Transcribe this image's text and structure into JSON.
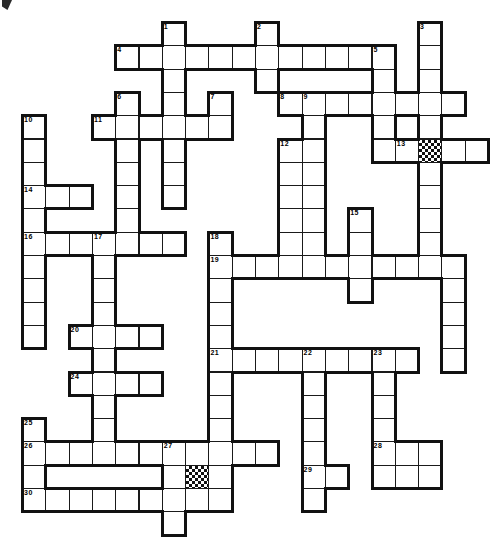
{
  "puzzle": {
    "title": "Crossword Puzzle Grid",
    "cell_size": 23.3,
    "origin_x": 22,
    "origin_y": 22,
    "cols": 20,
    "rows": 22,
    "line_color": "#111111",
    "cell_fill": "#ffffff",
    "shaded_fill_pattern": "checkerboard",
    "numbers_count": 30,
    "shaded_cells": [
      {
        "col": 17,
        "row": 5
      },
      {
        "col": 7,
        "row": 19
      }
    ],
    "clue_numbers": [
      {
        "n": "1",
        "col": 6,
        "row": 0
      },
      {
        "n": "2",
        "col": 10,
        "row": 0
      },
      {
        "n": "3",
        "col": 17,
        "row": 0
      },
      {
        "n": "4",
        "col": 4,
        "row": 1
      },
      {
        "n": "5",
        "col": 15,
        "row": 1
      },
      {
        "n": "6",
        "col": 4,
        "row": 3
      },
      {
        "n": "7",
        "col": 8,
        "row": 3
      },
      {
        "n": "8",
        "col": 11,
        "row": 3
      },
      {
        "n": "9",
        "col": 12,
        "row": 3
      },
      {
        "n": "10",
        "col": 0,
        "row": 4
      },
      {
        "n": "11",
        "col": 3,
        "row": 4
      },
      {
        "n": "12",
        "col": 11,
        "row": 5
      },
      {
        "n": "13",
        "col": 16,
        "row": 5
      },
      {
        "n": "14",
        "col": 0,
        "row": 7
      },
      {
        "n": "15",
        "col": 14,
        "row": 8
      },
      {
        "n": "16",
        "col": 0,
        "row": 9
      },
      {
        "n": "17",
        "col": 3,
        "row": 9
      },
      {
        "n": "18",
        "col": 8,
        "row": 9
      },
      {
        "n": "19",
        "col": 8,
        "row": 10
      },
      {
        "n": "20",
        "col": 2,
        "row": 13
      },
      {
        "n": "21",
        "col": 8,
        "row": 14
      },
      {
        "n": "22",
        "col": 12,
        "row": 14
      },
      {
        "n": "23",
        "col": 15,
        "row": 14
      },
      {
        "n": "24",
        "col": 2,
        "row": 15
      },
      {
        "n": "25",
        "col": 0,
        "row": 17
      },
      {
        "n": "26",
        "col": 0,
        "row": 18
      },
      {
        "n": "27",
        "col": 6,
        "row": 18
      },
      {
        "n": "28",
        "col": 15,
        "row": 18
      },
      {
        "n": "29",
        "col": 12,
        "row": 19
      },
      {
        "n": "30",
        "col": 0,
        "row": 20
      }
    ],
    "cells": [
      {
        "col": 6,
        "row": 0
      },
      {
        "col": 10,
        "row": 0
      },
      {
        "col": 17,
        "row": 0
      },
      {
        "col": 4,
        "row": 1
      },
      {
        "col": 5,
        "row": 1
      },
      {
        "col": 6,
        "row": 1
      },
      {
        "col": 7,
        "row": 1
      },
      {
        "col": 8,
        "row": 1
      },
      {
        "col": 9,
        "row": 1
      },
      {
        "col": 10,
        "row": 1
      },
      {
        "col": 11,
        "row": 1
      },
      {
        "col": 12,
        "row": 1
      },
      {
        "col": 13,
        "row": 1
      },
      {
        "col": 14,
        "row": 1
      },
      {
        "col": 15,
        "row": 1
      },
      {
        "col": 17,
        "row": 1
      },
      {
        "col": 6,
        "row": 2
      },
      {
        "col": 10,
        "row": 2
      },
      {
        "col": 15,
        "row": 2
      },
      {
        "col": 17,
        "row": 2
      },
      {
        "col": 4,
        "row": 3
      },
      {
        "col": 6,
        "row": 3
      },
      {
        "col": 8,
        "row": 3
      },
      {
        "col": 11,
        "row": 3
      },
      {
        "col": 12,
        "row": 3
      },
      {
        "col": 13,
        "row": 3
      },
      {
        "col": 14,
        "row": 3
      },
      {
        "col": 15,
        "row": 3
      },
      {
        "col": 16,
        "row": 3
      },
      {
        "col": 17,
        "row": 3
      },
      {
        "col": 18,
        "row": 3
      },
      {
        "col": 0,
        "row": 4
      },
      {
        "col": 3,
        "row": 4
      },
      {
        "col": 4,
        "row": 4
      },
      {
        "col": 5,
        "row": 4
      },
      {
        "col": 6,
        "row": 4
      },
      {
        "col": 7,
        "row": 4
      },
      {
        "col": 8,
        "row": 4
      },
      {
        "col": 12,
        "row": 4
      },
      {
        "col": 15,
        "row": 4
      },
      {
        "col": 17,
        "row": 4
      },
      {
        "col": 0,
        "row": 5
      },
      {
        "col": 4,
        "row": 5
      },
      {
        "col": 6,
        "row": 5
      },
      {
        "col": 11,
        "row": 5
      },
      {
        "col": 12,
        "row": 5
      },
      {
        "col": 15,
        "row": 5
      },
      {
        "col": 16,
        "row": 5
      },
      {
        "col": 17,
        "row": 5
      },
      {
        "col": 18,
        "row": 5
      },
      {
        "col": 19,
        "row": 5
      },
      {
        "col": 0,
        "row": 6
      },
      {
        "col": 4,
        "row": 6
      },
      {
        "col": 6,
        "row": 6
      },
      {
        "col": 11,
        "row": 6
      },
      {
        "col": 12,
        "row": 6
      },
      {
        "col": 17,
        "row": 6
      },
      {
        "col": 0,
        "row": 7
      },
      {
        "col": 1,
        "row": 7
      },
      {
        "col": 2,
        "row": 7
      },
      {
        "col": 4,
        "row": 7
      },
      {
        "col": 6,
        "row": 7
      },
      {
        "col": 11,
        "row": 7
      },
      {
        "col": 12,
        "row": 7
      },
      {
        "col": 17,
        "row": 7
      },
      {
        "col": 0,
        "row": 8
      },
      {
        "col": 4,
        "row": 8
      },
      {
        "col": 11,
        "row": 8
      },
      {
        "col": 12,
        "row": 8
      },
      {
        "col": 14,
        "row": 8
      },
      {
        "col": 17,
        "row": 8
      },
      {
        "col": 0,
        "row": 9
      },
      {
        "col": 1,
        "row": 9
      },
      {
        "col": 2,
        "row": 9
      },
      {
        "col": 3,
        "row": 9
      },
      {
        "col": 4,
        "row": 9
      },
      {
        "col": 5,
        "row": 9
      },
      {
        "col": 6,
        "row": 9
      },
      {
        "col": 8,
        "row": 9
      },
      {
        "col": 11,
        "row": 9
      },
      {
        "col": 12,
        "row": 9
      },
      {
        "col": 14,
        "row": 9
      },
      {
        "col": 17,
        "row": 9
      },
      {
        "col": 0,
        "row": 10
      },
      {
        "col": 3,
        "row": 10
      },
      {
        "col": 8,
        "row": 10
      },
      {
        "col": 9,
        "row": 10
      },
      {
        "col": 10,
        "row": 10
      },
      {
        "col": 11,
        "row": 10
      },
      {
        "col": 12,
        "row": 10
      },
      {
        "col": 13,
        "row": 10
      },
      {
        "col": 14,
        "row": 10
      },
      {
        "col": 15,
        "row": 10
      },
      {
        "col": 16,
        "row": 10
      },
      {
        "col": 17,
        "row": 10
      },
      {
        "col": 18,
        "row": 10
      },
      {
        "col": 0,
        "row": 11
      },
      {
        "col": 3,
        "row": 11
      },
      {
        "col": 8,
        "row": 11
      },
      {
        "col": 14,
        "row": 11
      },
      {
        "col": 18,
        "row": 11
      },
      {
        "col": 0,
        "row": 12
      },
      {
        "col": 3,
        "row": 12
      },
      {
        "col": 8,
        "row": 12
      },
      {
        "col": 18,
        "row": 12
      },
      {
        "col": 0,
        "row": 13
      },
      {
        "col": 2,
        "row": 13
      },
      {
        "col": 3,
        "row": 13
      },
      {
        "col": 4,
        "row": 13
      },
      {
        "col": 5,
        "row": 13
      },
      {
        "col": 8,
        "row": 13
      },
      {
        "col": 18,
        "row": 13
      },
      {
        "col": 3,
        "row": 14
      },
      {
        "col": 8,
        "row": 14
      },
      {
        "col": 9,
        "row": 14
      },
      {
        "col": 10,
        "row": 14
      },
      {
        "col": 11,
        "row": 14
      },
      {
        "col": 12,
        "row": 14
      },
      {
        "col": 13,
        "row": 14
      },
      {
        "col": 14,
        "row": 14
      },
      {
        "col": 15,
        "row": 14
      },
      {
        "col": 16,
        "row": 14
      },
      {
        "col": 18,
        "row": 14
      },
      {
        "col": 2,
        "row": 15
      },
      {
        "col": 3,
        "row": 15
      },
      {
        "col": 4,
        "row": 15
      },
      {
        "col": 5,
        "row": 15
      },
      {
        "col": 8,
        "row": 15
      },
      {
        "col": 12,
        "row": 15
      },
      {
        "col": 15,
        "row": 15
      },
      {
        "col": 3,
        "row": 16
      },
      {
        "col": 8,
        "row": 16
      },
      {
        "col": 12,
        "row": 16
      },
      {
        "col": 15,
        "row": 16
      },
      {
        "col": 0,
        "row": 17
      },
      {
        "col": 3,
        "row": 17
      },
      {
        "col": 8,
        "row": 17
      },
      {
        "col": 12,
        "row": 17
      },
      {
        "col": 15,
        "row": 17
      },
      {
        "col": 0,
        "row": 18
      },
      {
        "col": 1,
        "row": 18
      },
      {
        "col": 2,
        "row": 18
      },
      {
        "col": 3,
        "row": 18
      },
      {
        "col": 4,
        "row": 18
      },
      {
        "col": 5,
        "row": 18
      },
      {
        "col": 6,
        "row": 18
      },
      {
        "col": 7,
        "row": 18
      },
      {
        "col": 8,
        "row": 18
      },
      {
        "col": 9,
        "row": 18
      },
      {
        "col": 10,
        "row": 18
      },
      {
        "col": 12,
        "row": 18
      },
      {
        "col": 15,
        "row": 18
      },
      {
        "col": 16,
        "row": 18
      },
      {
        "col": 17,
        "row": 18
      },
      {
        "col": 0,
        "row": 19
      },
      {
        "col": 6,
        "row": 19
      },
      {
        "col": 7,
        "row": 19
      },
      {
        "col": 8,
        "row": 19
      },
      {
        "col": 12,
        "row": 19
      },
      {
        "col": 13,
        "row": 19
      },
      {
        "col": 15,
        "row": 19
      },
      {
        "col": 16,
        "row": 19
      },
      {
        "col": 17,
        "row": 19
      },
      {
        "col": 0,
        "row": 20
      },
      {
        "col": 1,
        "row": 20
      },
      {
        "col": 2,
        "row": 20
      },
      {
        "col": 3,
        "row": 20
      },
      {
        "col": 4,
        "row": 20
      },
      {
        "col": 5,
        "row": 20
      },
      {
        "col": 6,
        "row": 20
      },
      {
        "col": 7,
        "row": 20
      },
      {
        "col": 8,
        "row": 20
      },
      {
        "col": 12,
        "row": 20
      },
      {
        "col": 6,
        "row": 21
      }
    ]
  }
}
